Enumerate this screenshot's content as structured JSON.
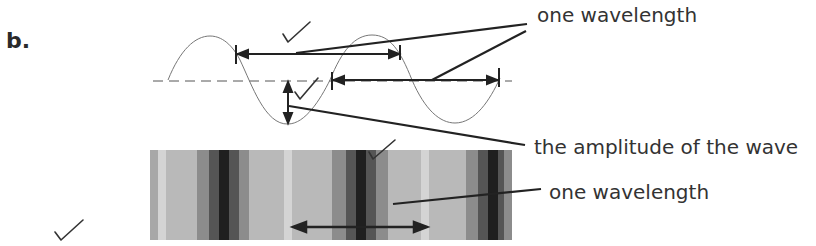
{
  "question": {
    "part_label": "b."
  },
  "labels": {
    "top_wavelength": "one wavelength",
    "amplitude": "the amplitude of the wave",
    "bottom_wavelength": "one wavelength"
  },
  "marks": {
    "check_count": 5
  },
  "stripes": {
    "light": "#b8b8b8",
    "pale": "#d6d6d6",
    "mid": "#8a8a8a",
    "dark": "#4a4a4a",
    "darkest": "#1c1c1c"
  }
}
